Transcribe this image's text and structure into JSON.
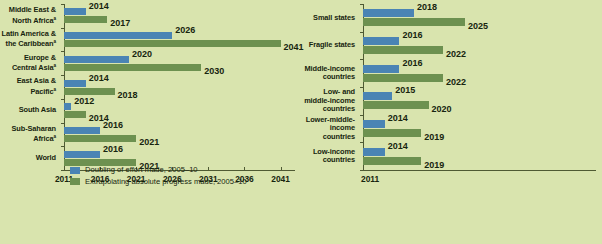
{
  "colors": {
    "background": "#d9e4ae",
    "blue": "#4a84b4",
    "green": "#6d9150",
    "axis": "#4f5a33",
    "text": "#17240f"
  },
  "legend": {
    "blue_label": "Doubling of effort made, 2005–10",
    "green_label": "Extrapolating absolute progress made, 2005–10"
  },
  "chart_data": [
    {
      "type": "bar",
      "orientation": "horizontal",
      "title": "",
      "xlabel": "",
      "ylabel": "",
      "xlim": [
        2011,
        2043
      ],
      "baseline": 2011,
      "grid": false,
      "legend_position": "bottom-left",
      "ticks": [
        "2011",
        "2016",
        "2021",
        "2026",
        "2031",
        "2036",
        "2041"
      ],
      "tick_values": [
        2011,
        2016,
        2021,
        2026,
        2031,
        2036,
        2041
      ],
      "categories": [
        "Middle East & North Africa",
        "Latin America & the Caribbean",
        "Europe & Central Asia",
        "East Asia & Pacific",
        "South Asia",
        "Sub-Saharan Africa",
        "World"
      ],
      "category_superscripts": [
        "a",
        "a",
        "a",
        "a",
        "",
        "a",
        ""
      ],
      "series": [
        {
          "name": "Doubling of effort made, 2005–10",
          "color": "#4a84b4",
          "values": [
            2014,
            2026,
            2020,
            2014,
            2012,
            2016,
            2016
          ],
          "labels": [
            "2014",
            "2026",
            "2020",
            "2014",
            "2012",
            "2016",
            "2016"
          ]
        },
        {
          "name": "Extrapolating absolute progress made, 2005–10",
          "color": "#6d9150",
          "values": [
            2017,
            2041,
            2030,
            2018,
            2014,
            2021,
            2021
          ],
          "labels": [
            "2017",
            "2041",
            "2030",
            "2018",
            "2014",
            "2021",
            "2021"
          ]
        }
      ]
    },
    {
      "type": "bar",
      "orientation": "horizontal",
      "title": "",
      "xlabel": "",
      "ylabel": "",
      "xlim": [
        2011,
        2043
      ],
      "baseline": 2011,
      "grid": false,
      "legend_position": "bottom-left",
      "ticks": [
        "2011"
      ],
      "tick_values": [
        2011
      ],
      "categories": [
        "Small states",
        "Fragile states",
        "Middle-income countries",
        "Low- and middle-income countries",
        "Lower-middle-income countries",
        "Low-income countries"
      ],
      "category_superscripts": [
        "",
        "",
        "",
        "",
        "",
        ""
      ],
      "series": [
        {
          "name": "Doubling of effort made, 2005–10",
          "color": "#4a84b4",
          "values": [
            2018,
            2016,
            2016,
            2015,
            2014,
            2014
          ],
          "labels": [
            "2018",
            "2016",
            "2016",
            "2015",
            "2014",
            "2014"
          ]
        },
        {
          "name": "Extrapolating absolute progress made, 2005–10",
          "color": "#6d9150",
          "values": [
            2025,
            2022,
            2022,
            2020,
            2019,
            2019
          ],
          "labels": [
            "2025",
            "2022",
            "2022",
            "2020",
            "2019",
            "2019"
          ]
        }
      ]
    }
  ]
}
